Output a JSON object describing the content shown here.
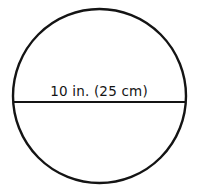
{
  "figure": {
    "type": "geometry-diagram",
    "shape": "circle",
    "background_color": "#ffffff",
    "stroke_color": "#141414",
    "circle": {
      "center_x": 99.5,
      "center_y": 96,
      "radius_x": 86.5,
      "radius_y": 87,
      "stroke_width": 2.4
    },
    "diameter_line": {
      "x1": 13,
      "y1": 102,
      "x2": 186,
      "y2": 102,
      "stroke_width": 2
    },
    "diameter_label": "10 in. (25 cm)",
    "measurement": {
      "inches_value": "10",
      "inches_unit": "in.",
      "metric_value": "25",
      "metric_unit": "cm"
    },
    "cut_off_top_text": "10 in. (25 cm)"
  }
}
